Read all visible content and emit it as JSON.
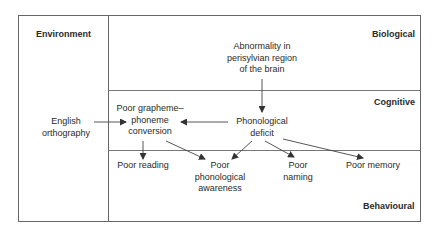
{
  "diagram": {
    "regions": {
      "environment": "Environment",
      "biological": "Biological",
      "cognitive": "Cognitive",
      "behavioural": "Behavioural"
    },
    "nodes": {
      "abnormality": [
        "Abnormality in",
        "perisylvian region",
        "of the brain"
      ],
      "english_orthography": [
        "English",
        "orthography"
      ],
      "poor_gpc": [
        "Poor grapheme–",
        "phoneme",
        "conversion"
      ],
      "phonological_deficit": [
        "Phonological",
        "deficit"
      ],
      "poor_reading": [
        "Poor reading"
      ],
      "poor_phon_awareness": [
        "Poor",
        "phonological",
        "awareness"
      ],
      "poor_naming": [
        "Poor",
        "naming"
      ],
      "poor_memory": [
        "Poor memory"
      ]
    },
    "edges": [
      {
        "from": "Abnormality in perisylvian region of the brain",
        "to": "Phonological deficit"
      },
      {
        "from": "English orthography",
        "to": "Poor grapheme–phoneme conversion"
      },
      {
        "from": "Phonological deficit",
        "to": "Poor grapheme–phoneme conversion"
      },
      {
        "from": "Poor grapheme–phoneme conversion",
        "to": "Poor reading"
      },
      {
        "from": "Poor grapheme–phoneme conversion",
        "to": "Poor phonological awareness"
      },
      {
        "from": "Phonological deficit",
        "to": "Poor phonological awareness"
      },
      {
        "from": "Phonological deficit",
        "to": "Poor naming"
      },
      {
        "from": "Phonological deficit",
        "to": "Poor memory"
      }
    ],
    "colors": {
      "line": "#555555",
      "text": "#2a2a2a",
      "background": "#ffffff"
    }
  }
}
